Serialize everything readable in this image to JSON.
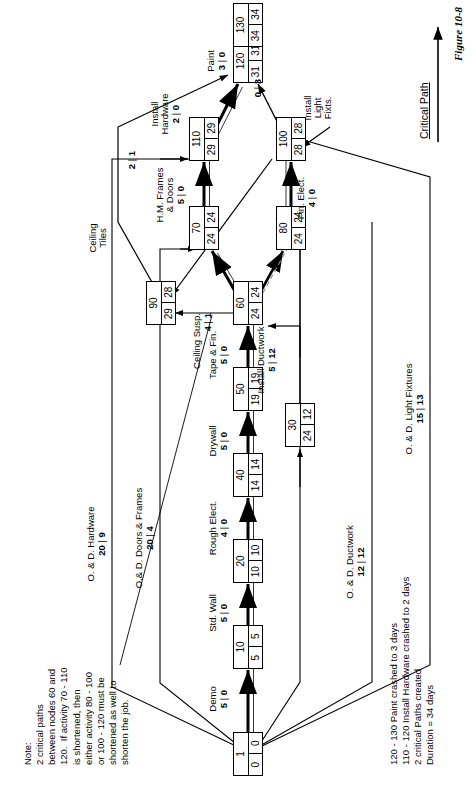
{
  "figure": {
    "caption": "Figure 10-8",
    "legend_label": "Critical Path"
  },
  "note": {
    "text": "Note:\n2 critical paths\nbetween nodes 60 and\n120.  If activity 70 - 110\nis shortened, then\neither activity 80 - 100\nor 100 - 120 must be\nshortened as well to\nshorten the job."
  },
  "summary": {
    "text": "120 - 130 Paint crashed to 3 days\n110 - 120 Install Hardware crashed to 2 days\n2 critical Paths created\nDuration = 34 days"
  },
  "nodes": [
    {
      "id": "1",
      "early": "0",
      "late": "0"
    },
    {
      "id": "10",
      "early": "5",
      "late": "5"
    },
    {
      "id": "20",
      "early": "10",
      "late": "10"
    },
    {
      "id": "30",
      "early": "24",
      "late": "12"
    },
    {
      "id": "40",
      "early": "14",
      "late": "14"
    },
    {
      "id": "50",
      "early": "19",
      "late": "19"
    },
    {
      "id": "60",
      "early": "24",
      "late": "24"
    },
    {
      "id": "70",
      "early": "24",
      "late": "24"
    },
    {
      "id": "80",
      "early": "24",
      "late": "24"
    },
    {
      "id": "90",
      "early": "29",
      "late": "28"
    },
    {
      "id": "100",
      "early": "28",
      "late": "28"
    },
    {
      "id": "110",
      "early": "29",
      "late": "29"
    },
    {
      "id": "120",
      "early": "31",
      "late": "31"
    },
    {
      "id": "130",
      "early": "34",
      "late": "34"
    }
  ],
  "activities": [
    {
      "name": "Demo",
      "duration": "5",
      "float": "0",
      "critical": true
    },
    {
      "name": "Std. Wall",
      "duration": "5",
      "float": "0",
      "critical": true
    },
    {
      "name": "Rough Elect.",
      "duration": "4",
      "float": "0",
      "critical": true
    },
    {
      "name": "Drywall",
      "duration": "5",
      "float": "0",
      "critical": true
    },
    {
      "name": "Tape & Fin.",
      "duration": "5",
      "float": "0",
      "critical": true
    },
    {
      "name": "H.M. Frames\n& Doors",
      "duration": "5",
      "float": "0",
      "critical": true
    },
    {
      "name": "Ceiling Susp.",
      "duration": "4",
      "float": "1",
      "critical": false
    },
    {
      "name": "Ceiling\nTiles",
      "duration": "2",
      "float": "1",
      "critical": false
    },
    {
      "name": "Fin. Elect.",
      "duration": "4",
      "float": "0",
      "critical": true
    },
    {
      "name": "Install\nLight\nFixts.",
      "duration": "0",
      "float": "3",
      "critical": false
    },
    {
      "name": "Install\nHardware",
      "duration": "2",
      "float": "0",
      "critical": true
    },
    {
      "name": "Paint",
      "duration": "3",
      "float": "0",
      "critical": true
    },
    {
      "name": "O. & D. Ductwork",
      "duration": "12",
      "float": "12",
      "critical": false
    },
    {
      "name": "Install Ductwork",
      "duration": "5",
      "float": "12",
      "critical": false
    },
    {
      "name": "O. & D. Hardware",
      "duration": "20",
      "float": "9",
      "critical": false
    },
    {
      "name": "O.& D. Doors & Frames",
      "duration": "20",
      "float": "4",
      "critical": false
    },
    {
      "name": "O. & D. Light Fixtures",
      "duration": "15",
      "float": "13",
      "critical": false
    }
  ],
  "colors": {
    "line": "#000000",
    "background": "#ffffff",
    "critical_dash": "#6f6f6f"
  }
}
